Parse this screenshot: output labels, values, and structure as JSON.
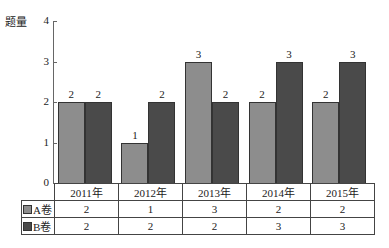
{
  "chart_data": {
    "type": "bar",
    "title": "",
    "ylabel": "题量",
    "xlabel": "",
    "ylim": [
      0,
      4
    ],
    "yticks": [
      0,
      1,
      2,
      3,
      4
    ],
    "grid": false,
    "legend_position": "table-left",
    "categories": [
      "2011年",
      "2012年",
      "2013年",
      "2014年",
      "2015年"
    ],
    "series": [
      {
        "name": "A卷",
        "color": "#8d8d8d",
        "values": [
          2,
          1,
          3,
          2,
          2
        ]
      },
      {
        "name": "B卷",
        "color": "#4a4a4a",
        "values": [
          2,
          2,
          2,
          3,
          3
        ]
      }
    ],
    "data_table": true
  },
  "axis": {
    "ylabel": "题量",
    "ticks": [
      "0",
      "1",
      "2",
      "3",
      "4"
    ]
  },
  "table": {
    "headers": [
      "2011年",
      "2012年",
      "2013年",
      "2014年",
      "2015年"
    ],
    "rows": [
      {
        "label": "A卷",
        "cells": [
          "2",
          "1",
          "3",
          "2",
          "2"
        ]
      },
      {
        "label": "B卷",
        "cells": [
          "2",
          "2",
          "2",
          "3",
          "3"
        ]
      }
    ]
  },
  "bars": {
    "a": [
      "2",
      "1",
      "3",
      "2",
      "2"
    ],
    "b": [
      "2",
      "2",
      "2",
      "3",
      "3"
    ]
  }
}
